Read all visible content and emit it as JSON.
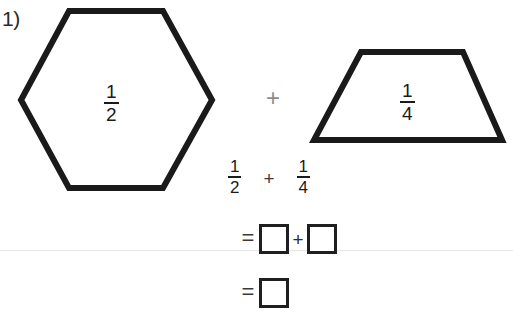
{
  "worksheet": {
    "problem_number": "1)",
    "background_color": "#ffffff",
    "ink_color": "#1a1a1a",
    "rule_color": "#e6e6e6"
  },
  "shapes": [
    {
      "name": "hexagon",
      "kind": "hexagon",
      "label_numerator": "1",
      "label_denominator": "2",
      "label_text": "1/2",
      "outline_color": "#1a1a1a"
    },
    {
      "name": "trapezoid",
      "kind": "trapezoid",
      "label_numerator": "1",
      "label_denominator": "4",
      "label_text": "1/4",
      "outline_color": "#1a1a1a"
    }
  ],
  "shape_operator": "+",
  "equation": {
    "left_numerator": "1",
    "left_denominator": "2",
    "operator": "+",
    "right_numerator": "1",
    "right_denominator": "4"
  },
  "answer_rows": [
    {
      "name": "answer-row-1",
      "equals": "=",
      "operator": "+",
      "box_1_value": "",
      "box_2_value": ""
    },
    {
      "name": "answer-row-2",
      "equals": "=",
      "box_1_value": ""
    }
  ]
}
